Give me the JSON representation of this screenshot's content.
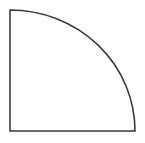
{
  "canvas": {
    "width": 145,
    "height": 143,
    "background_color": "#ffffff",
    "title": "Quarter circle outline"
  },
  "figure": {
    "name": "quarter-circle",
    "fill_color": "#ffffff",
    "stroke_color": "#3a3a3a",
    "stroke_width": 1.6,
    "center": {
      "x": 10,
      "y": 10
    },
    "radius_x": 125,
    "radius_y": 121,
    "vertices": {
      "corner": {
        "x": 10,
        "y": 10
      },
      "bottom_left": {
        "x": 10,
        "y": 131
      },
      "bottom_right": {
        "x": 135,
        "y": 131
      }
    },
    "edges": [
      {
        "name": "left-edge",
        "type": "line",
        "from": {
          "x": 10,
          "y": 10
        },
        "to": {
          "x": 10,
          "y": 131
        }
      },
      {
        "name": "bottom-edge",
        "type": "line",
        "from": {
          "x": 10,
          "y": 131
        },
        "to": {
          "x": 135,
          "y": 131
        }
      },
      {
        "name": "arc-edge",
        "type": "arc",
        "from": {
          "x": 135,
          "y": 131
        },
        "to": {
          "x": 10,
          "y": 10
        },
        "sweep": "convex"
      }
    ],
    "path_d": "M 10 10 L 10 131 L 135 131 A 125 121 0 0 0 10 10 Z"
  }
}
